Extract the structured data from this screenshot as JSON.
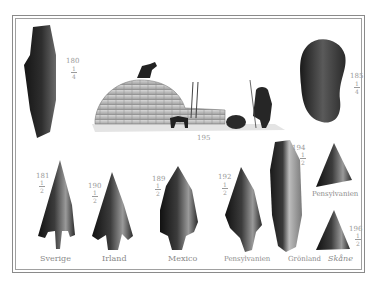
{
  "plate": {
    "figures": [
      {
        "id": "fig-180",
        "number": "180",
        "scale_num": "1",
        "scale_den": "4",
        "object": "stone axe"
      },
      {
        "id": "fig-185",
        "number": "185",
        "scale_num": "1",
        "scale_den": "4",
        "object": "stone tool"
      },
      {
        "id": "fig-195",
        "number": "195",
        "object": "igloo scene"
      },
      {
        "id": "fig-181",
        "number": "181",
        "scale_num": "1",
        "scale_den": "2",
        "place": "Sverige"
      },
      {
        "id": "fig-190",
        "number": "190",
        "scale_num": "1",
        "scale_den": "2",
        "place": "Irland"
      },
      {
        "id": "fig-189",
        "number": "189",
        "scale_num": "1",
        "scale_den": "2",
        "place": "Mexico"
      },
      {
        "id": "fig-192",
        "number": "192",
        "scale_num": "1",
        "scale_den": "2",
        "place": "Pensylvanien"
      },
      {
        "id": "fig-194",
        "number": "194",
        "scale_num": "1",
        "scale_den": "2",
        "place": "Grönland"
      },
      {
        "id": "fig-pen",
        "place": "Pensylvanien"
      },
      {
        "id": "fig-196",
        "number": "196",
        "scale_num": "1",
        "scale_den": "2",
        "place": "Skåne"
      }
    ]
  },
  "colors": {
    "ink": "#1e1e1e",
    "label": "#8a8a8a",
    "paper": "#ffffff"
  }
}
